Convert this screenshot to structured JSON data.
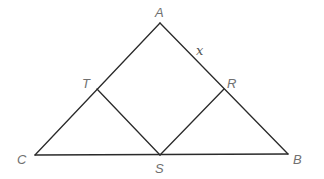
{
  "diagram": {
    "type": "geometry",
    "points": {
      "A": {
        "label": "A",
        "x": 160,
        "y": 23
      },
      "B": {
        "label": "B",
        "x": 288,
        "y": 154
      },
      "C": {
        "label": "C",
        "x": 35,
        "y": 155
      },
      "T": {
        "label": "T",
        "x": 97,
        "y": 89
      },
      "R": {
        "label": "R",
        "x": 224,
        "y": 89
      },
      "S": {
        "label": "S",
        "x": 160,
        "y": 155
      }
    },
    "labels": {
      "A": "A",
      "B": "B",
      "C": "C",
      "T": "T",
      "R": "R",
      "S": "S",
      "side_AR": "x"
    },
    "segments": [
      [
        "A",
        "C"
      ],
      [
        "A",
        "B"
      ],
      [
        "C",
        "B"
      ],
      [
        "T",
        "S"
      ],
      [
        "S",
        "R"
      ]
    ],
    "colors": {
      "line": "#2a2a2a",
      "label": "#707070",
      "background": "#ffffff"
    }
  }
}
